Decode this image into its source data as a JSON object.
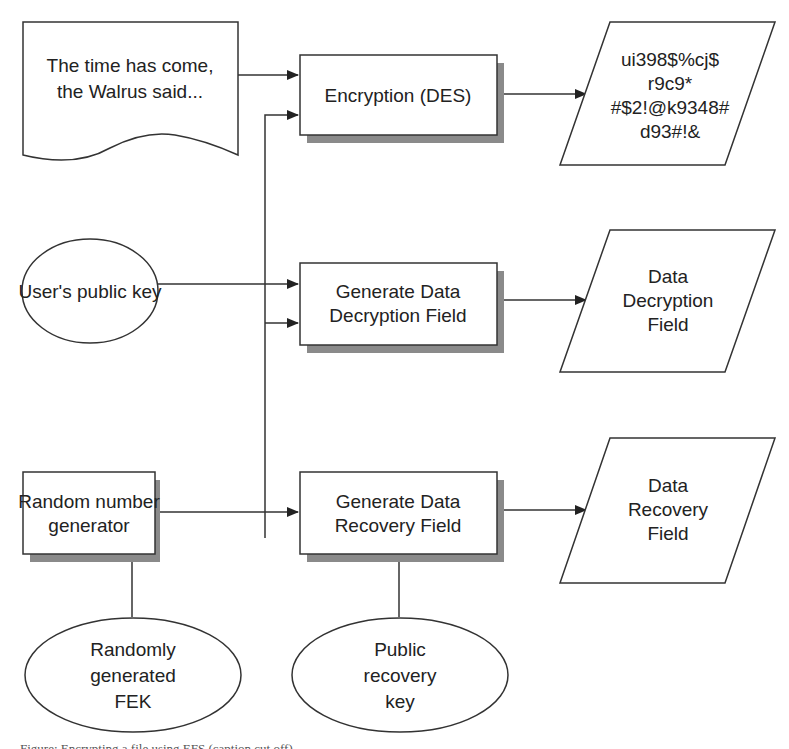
{
  "diagram": {
    "nodes": {
      "plaintext": {
        "shape": "document",
        "lines": [
          "The time has come,",
          "the Walrus said..."
        ]
      },
      "encryption": {
        "shape": "process",
        "lines": [
          "Encryption (DES)"
        ]
      },
      "ciphertext": {
        "shape": "data",
        "lines": [
          "ui398$%cj$",
          "r9c9*",
          "#$2!@k9348#",
          "d93#!&"
        ]
      },
      "user_public_key": {
        "shape": "ellipse",
        "lines": [
          "User's public key"
        ]
      },
      "gen_ddf": {
        "shape": "process",
        "lines": [
          "Generate Data",
          "Decryption Field"
        ]
      },
      "ddf": {
        "shape": "data",
        "lines": [
          "Data",
          "Decryption",
          "Field"
        ]
      },
      "rng": {
        "shape": "process",
        "lines": [
          "Random number",
          "generator"
        ]
      },
      "gen_drf": {
        "shape": "process",
        "lines": [
          "Generate Data",
          "Recovery Field"
        ]
      },
      "drf": {
        "shape": "data",
        "lines": [
          "Data",
          "Recovery",
          "Field"
        ]
      },
      "fek": {
        "shape": "ellipse",
        "lines": [
          "Randomly",
          "generated",
          "FEK"
        ]
      },
      "recovery_key": {
        "shape": "ellipse",
        "lines": [
          "Public",
          "recovery",
          "key"
        ]
      }
    },
    "edges": [
      {
        "from": "plaintext",
        "to": "encryption"
      },
      {
        "from": "rng",
        "to": "encryption"
      },
      {
        "from": "encryption",
        "to": "ciphertext"
      },
      {
        "from": "user_public_key",
        "to": "gen_ddf"
      },
      {
        "from": "rng",
        "to": "gen_ddf"
      },
      {
        "from": "gen_ddf",
        "to": "ddf"
      },
      {
        "from": "rng",
        "to": "gen_drf"
      },
      {
        "from": "gen_drf",
        "to": "drf"
      },
      {
        "from": "fek",
        "to": "rng",
        "style": "line"
      },
      {
        "from": "recovery_key",
        "to": "gen_drf",
        "style": "line"
      }
    ],
    "caption_partial": "Figure: Encrypting a file using EFS (caption cut off)"
  }
}
